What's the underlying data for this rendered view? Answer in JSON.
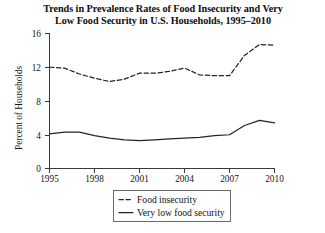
{
  "chart_data": {
    "type": "line",
    "title": "Trends in Prevalence Rates of Food Insecurity and Very Low Food Security in U.S. Households, 1995–2010",
    "title_line1": "Trends in Prevalence Rates of Food Insecurity and Very",
    "title_line2": "Low Food Security in U.S. Households, 1995–2010",
    "xlabel": "",
    "ylabel": "Percent of Households",
    "x": [
      1995,
      1996,
      1997,
      1998,
      1999,
      2000,
      2001,
      2002,
      2003,
      2004,
      2005,
      2006,
      2007,
      2008,
      2009,
      2010
    ],
    "xlim": [
      1995,
      2010
    ],
    "ylim": [
      0,
      16
    ],
    "xticks": [
      1995,
      1998,
      2001,
      2004,
      2007,
      2010
    ],
    "xtick_labels": [
      "1995",
      "1998",
      "2001",
      "2004",
      "2007",
      "2010"
    ],
    "yticks": [
      0,
      4,
      8,
      12,
      16
    ],
    "ytick_labels": [
      "0",
      "4",
      "8",
      "12",
      "16"
    ],
    "grid": false,
    "legend_position": "bottom-center",
    "series": [
      {
        "name": "Food insecurity",
        "style": "dashed",
        "color": "#242424",
        "values": [
          12.0,
          11.9,
          11.2,
          10.7,
          10.3,
          10.6,
          11.3,
          11.3,
          11.5,
          11.9,
          11.1,
          11.0,
          11.0,
          13.4,
          14.7,
          14.6
        ]
      },
      {
        "name": "Very low food security",
        "style": "solid",
        "color": "#242424",
        "values": [
          4.1,
          4.3,
          4.3,
          3.9,
          3.6,
          3.4,
          3.3,
          3.4,
          3.5,
          3.6,
          3.7,
          3.9,
          4.0,
          5.1,
          5.7,
          5.4
        ]
      }
    ]
  },
  "legend": {
    "items": [
      {
        "label": "Food insecurity",
        "style": "dashed"
      },
      {
        "label": "Very low food security",
        "style": "solid"
      }
    ]
  },
  "axes": {
    "y_axis_title": "Percent of Households"
  }
}
